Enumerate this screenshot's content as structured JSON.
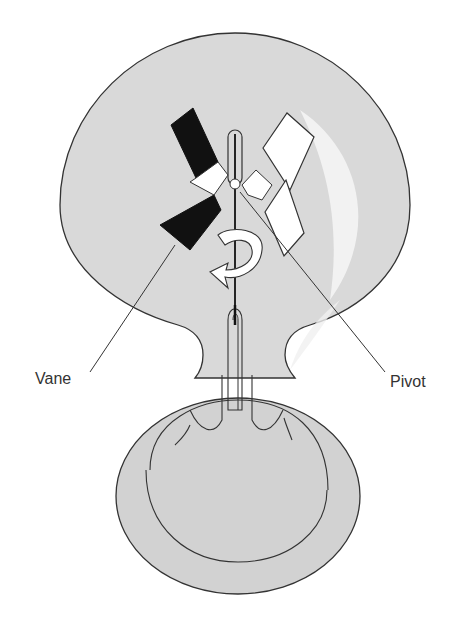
{
  "figure": {
    "labels": {
      "vane": "Vane",
      "pivot": "Pivot"
    }
  },
  "colors": {
    "glass_fill": "#d9d9d9",
    "outline": "#333333",
    "dark_vane": "#111111",
    "light_vane": "#ffffff",
    "highlight": "#f2f2f2"
  }
}
